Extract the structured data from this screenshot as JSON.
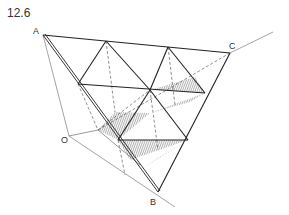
{
  "figure": {
    "number": "12.6",
    "labels": {
      "A": "A",
      "B": "B",
      "C": "C",
      "O": "O"
    }
  },
  "colors": {
    "line": "#222222",
    "hatch": "#555555",
    "thin": "#666666"
  }
}
